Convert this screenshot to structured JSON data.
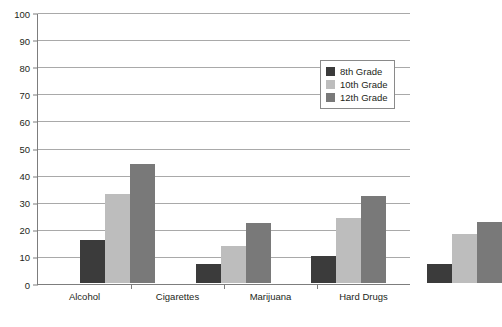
{
  "chart_data": {
    "type": "bar",
    "title": "",
    "subtitle": "",
    "xlabel": "",
    "ylabel": "",
    "categories": [
      "Alcohol",
      "Cigarettes",
      "Marijuana",
      "Hard Drugs"
    ],
    "series": [
      {
        "name": "8th Grade",
        "color": "#3b3b3b",
        "values": [
          16,
          7,
          10,
          7
        ]
      },
      {
        "name": "10th Grade",
        "color": "#bdbdbd",
        "values": [
          33,
          13.5,
          24,
          18
        ]
      },
      {
        "name": "12th Grade",
        "color": "#797979",
        "values": [
          44,
          22,
          32,
          22.5
        ]
      }
    ],
    "ylim": [
      0,
      100
    ],
    "yticks": [
      0,
      10,
      20,
      30,
      40,
      50,
      60,
      70,
      80,
      90,
      100
    ],
    "ytick_labels": [
      "0",
      "10",
      "20",
      "30",
      "40",
      "50",
      "60",
      "70",
      "80",
      "90",
      "100"
    ],
    "grid": true,
    "legend_position": "upper right",
    "annotations": []
  },
  "legend": {
    "entries": [
      {
        "label": "8th Grade"
      },
      {
        "label": "10th Grade"
      },
      {
        "label": "12th Grade"
      }
    ]
  },
  "colors": {
    "series_8th": "#3b3b3b",
    "series_10th": "#bdbdbd",
    "series_12th": "#797979",
    "gridline": "#a9a9a9",
    "axis": "#7d7d7d",
    "text": "#231f20",
    "background": "#ffffff"
  }
}
